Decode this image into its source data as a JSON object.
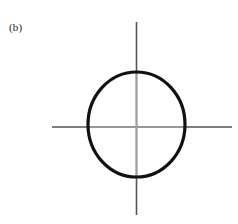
{
  "figure": {
    "panel_label": "(b)",
    "background_color": "#ffffff",
    "width": 238,
    "height": 224
  },
  "axes": {
    "origin_x": 136.5,
    "origin_y": 127,
    "outer_color": "#555555",
    "inner_color": "#a0a0a0",
    "line_width": 1.6,
    "horizontal": {
      "name": "horizontal-axis",
      "x_start": 52,
      "x_end": 232,
      "y": 127
    },
    "vertical": {
      "name": "vertical-axis",
      "y_start": 22,
      "y_end": 215,
      "x": 136.5
    }
  },
  "chart_data": {
    "type": "line",
    "title": "(b)",
    "xlabel": "",
    "ylabel": "",
    "grid": false,
    "legend": null,
    "annotations": [
      "(b)"
    ],
    "curves": [
      {
        "name": "closed-orbit-curve",
        "shape": "ellipse",
        "center_x": 136.5,
        "center_y": 124.5,
        "radius_x": 48.5,
        "radius_y": 52.5,
        "stroke_color": "#111111",
        "stroke_width": 3.2,
        "closed": true,
        "filled": false
      }
    ],
    "axis_crossings": {
      "x_axis_left": 88,
      "x_axis_right": 185,
      "y_axis_top": 72,
      "y_axis_bottom": 177
    }
  }
}
